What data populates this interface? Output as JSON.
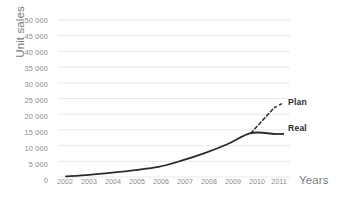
{
  "chart_data": {
    "type": "line",
    "title": "",
    "xlabel": "Years",
    "ylabel": "Unit sales",
    "x": [
      2002,
      2003,
      2004,
      2005,
      2006,
      2007,
      2008,
      2009,
      2010,
      2011
    ],
    "xtick_labels": [
      "2002",
      "2003",
      "2004",
      "2005",
      "2006",
      "2007",
      "2008",
      "2009",
      "2010",
      "2011"
    ],
    "ytick_labels": [
      "50 000",
      "45 000",
      "40 000",
      "35 000",
      "30 000",
      "25 000",
      "20 000",
      "15 000",
      "10 000",
      "5 000",
      "0"
    ],
    "ytick_values": [
      50000,
      45000,
      40000,
      35000,
      30000,
      25000,
      20000,
      15000,
      10000,
      5000,
      0
    ],
    "ylim": [
      0,
      50000
    ],
    "xlim": [
      2002,
      2011
    ],
    "grid": "horizontal",
    "legend": "inline-right-labels",
    "series": [
      {
        "name": "Real",
        "style": "solid",
        "color": "#2b2b2b",
        "x": [
          2002,
          2003,
          2004,
          2005,
          2006,
          2007,
          2008,
          2009,
          2010,
          2011
        ],
        "values": [
          200,
          700,
          1400,
          2200,
          3200,
          5200,
          7600,
          10500,
          14000,
          13700
        ]
      },
      {
        "name": "Plan",
        "style": "dashed",
        "color": "#2b2b2b",
        "x": [
          2010,
          2011
        ],
        "values": [
          14000,
          22000
        ]
      }
    ],
    "annotations": [
      {
        "text": "Plan",
        "x": 2011,
        "y": 22000
      },
      {
        "text": "Real",
        "x": 2011,
        "y": 13700
      }
    ]
  },
  "colors": {
    "background": "#ffffff",
    "gridline": "#e8e8e8",
    "tick_text": "#8a8a8a",
    "axis_title": "#7b7b7b",
    "series_line": "#2b2b2b"
  }
}
